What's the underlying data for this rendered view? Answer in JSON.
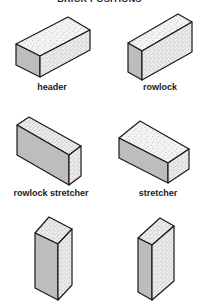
{
  "title": "BRICK POSITIONS",
  "colors": {
    "outline": "#1a1a1a",
    "grey_face": "#bdbdbd",
    "light_face": "#f4f4f4",
    "stipple": "#8a8a8a",
    "background": "#ffffff"
  },
  "bricks": [
    {
      "label": "header"
    },
    {
      "label": "rowlock"
    },
    {
      "label": "rowlock stretcher"
    },
    {
      "label": "stretcher"
    },
    {
      "label": ""
    },
    {
      "label": ""
    }
  ]
}
